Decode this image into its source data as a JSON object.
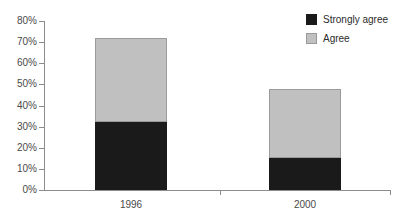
{
  "chart_data": {
    "type": "bar",
    "stacked": true,
    "orientation": "vertical",
    "title": "",
    "subtitle": "",
    "xlabel": "",
    "ylabel": "",
    "categories": [
      "1996",
      "2000"
    ],
    "series": [
      {
        "name": "Strongly agree",
        "color": "#1a1a1a",
        "values": [
          32,
          15
        ]
      },
      {
        "name": "Agree",
        "color": "#c0c0c0",
        "values": [
          40,
          33
        ]
      }
    ],
    "totals": [
      72,
      48
    ],
    "ylim": [
      0,
      80
    ],
    "ytick_step": 10,
    "ytick_labels": [
      "0%",
      "10%",
      "20%",
      "30%",
      "40%",
      "50%",
      "60%",
      "70%",
      "80%"
    ],
    "ytick_values": [
      0,
      10,
      20,
      30,
      40,
      50,
      60,
      70,
      80
    ],
    "grid": false,
    "legend_position": "top-right",
    "value_suffix": "%"
  },
  "legend": {
    "items": [
      {
        "label": "Strongly agree",
        "swatch": "legend-swatch-strongly-agree"
      },
      {
        "label": "Agree",
        "swatch": "legend-swatch-agree"
      }
    ]
  },
  "axes": {
    "y_ticks": [
      {
        "label": "80%",
        "value": 80
      },
      {
        "label": "70%",
        "value": 70
      },
      {
        "label": "60%",
        "value": 60
      },
      {
        "label": "50%",
        "value": 50
      },
      {
        "label": "40%",
        "value": 40
      },
      {
        "label": "30%",
        "value": 30
      },
      {
        "label": "20%",
        "value": 20
      },
      {
        "label": "10%",
        "value": 10
      },
      {
        "label": "0%",
        "value": 0
      }
    ],
    "x_ticks": [
      {
        "label": "1996"
      },
      {
        "label": "2000"
      }
    ]
  },
  "colors": {
    "strongly_agree": "#1a1a1a",
    "agree": "#c0c0c0",
    "axis": "#8c8c8c",
    "text": "#4a4a4a",
    "background": "#ffffff"
  }
}
